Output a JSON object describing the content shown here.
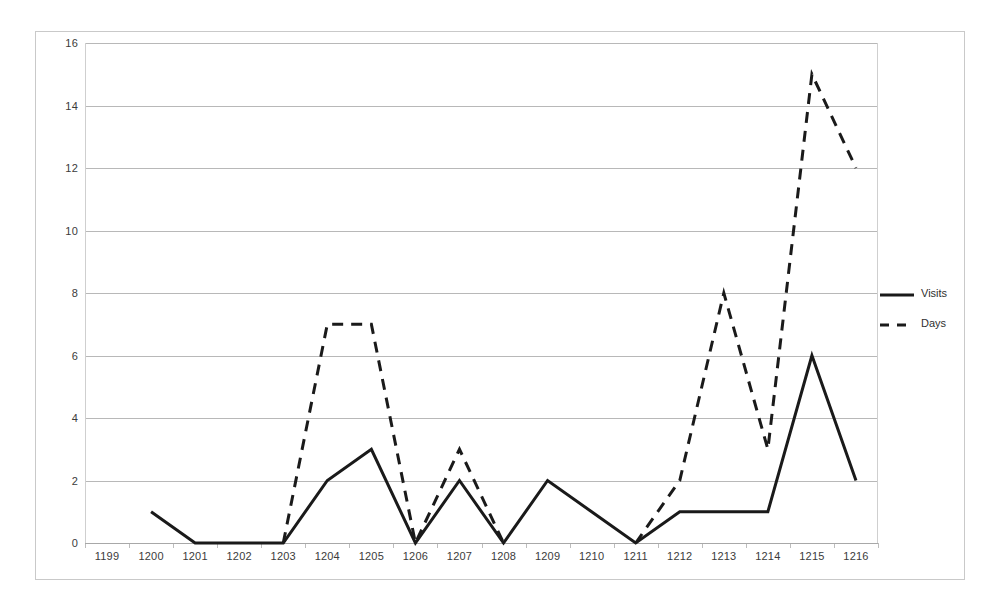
{
  "chart_data": {
    "type": "line",
    "title": "",
    "subtitle": "",
    "xlabel": "",
    "ylabel": "",
    "categories": [
      "1199",
      "1200",
      "1201",
      "1202",
      "1203",
      "1204",
      "1205",
      "1206",
      "1207",
      "1208",
      "1209",
      "1210",
      "1211",
      "1212",
      "1213",
      "1214",
      "1215",
      "1216"
    ],
    "ylim": [
      0,
      16
    ],
    "yticks": [
      0,
      2,
      4,
      6,
      8,
      10,
      12,
      14,
      16
    ],
    "ytick_labels": [
      "0",
      "2",
      "4",
      "6",
      "8",
      "10",
      "12",
      "14",
      "16"
    ],
    "grid": true,
    "grid_axis": "y",
    "legend_position": "right",
    "series": [
      {
        "name": "Visits",
        "style": "solid",
        "color": "#1a1a1a",
        "values": [
          null,
          1,
          0,
          0,
          0,
          2,
          3,
          0,
          2,
          0,
          2,
          1,
          0,
          1,
          1,
          1,
          6,
          2
        ]
      },
      {
        "name": "Days",
        "style": "dashed",
        "color": "#1a1a1a",
        "values": [
          null,
          null,
          null,
          null,
          0,
          7,
          7,
          0,
          3,
          0,
          null,
          null,
          0,
          2,
          8,
          3,
          15,
          12
        ]
      }
    ]
  },
  "legend": {
    "entries": [
      {
        "label": "Visits",
        "style": "solid"
      },
      {
        "label": "Days",
        "style": "dashed"
      }
    ]
  }
}
